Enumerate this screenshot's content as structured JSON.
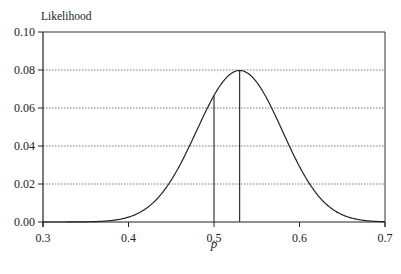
{
  "chart_data": {
    "type": "line",
    "title": "",
    "xlabel": "p",
    "ylabel": "Likelihood",
    "xlim": [
      0.3,
      0.7
    ],
    "ylim": [
      0,
      0.1
    ],
    "x_ticks": [
      "0.3",
      "0.4",
      "0.5",
      "0.6",
      "0.7"
    ],
    "y_ticks": [
      "0.00",
      "0.02",
      "0.04",
      "0.06",
      "0.08",
      "0.10"
    ],
    "grid": {
      "horizontal": true,
      "style": "dotted",
      "vertical": false
    },
    "legend": null,
    "model": {
      "distribution": "binomial",
      "n": 100,
      "k": 53
    },
    "series": [
      {
        "name": "Likelihood",
        "x": [
          0.3,
          0.35,
          0.38,
          0.4,
          0.42,
          0.44,
          0.46,
          0.48,
          0.5,
          0.52,
          0.53,
          0.54,
          0.56,
          0.58,
          0.6,
          0.62,
          0.64,
          0.66,
          0.68,
          0.7
        ],
        "values": [
          0.0,
          0.0,
          0.0003,
          0.0011,
          0.0041,
          0.0117,
          0.0262,
          0.0467,
          0.0666,
          0.0786,
          0.0797,
          0.0787,
          0.067,
          0.0483,
          0.0285,
          0.0135,
          0.005,
          0.0014,
          0.0003,
          0.0
        ]
      }
    ],
    "annotations": [
      {
        "type": "vertical_line",
        "x": 0.5,
        "y_top": 0.0666,
        "label": ""
      },
      {
        "type": "vertical_line",
        "x": 0.53,
        "y_top": 0.0797,
        "label": ""
      }
    ]
  }
}
